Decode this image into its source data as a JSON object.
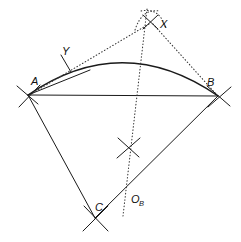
{
  "figure": {
    "canvas": {
      "width": 241,
      "height": 242,
      "background": "#ffffff"
    },
    "colors": {
      "solid_line": "#1a1a1a",
      "dotted_line": "#3a3a3a",
      "label_text": "#111111"
    },
    "labels": {
      "a": "A",
      "b": "B",
      "c": "C",
      "x": "X",
      "y": "Y",
      "o": "O",
      "o_sub": "B"
    },
    "points": {
      "A": {
        "x": 28,
        "y": 95
      },
      "B": {
        "x": 218,
        "y": 96
      },
      "C": {
        "x": 95,
        "y": 218
      },
      "X": {
        "x": 151,
        "y": 22
      },
      "Y": {
        "x": 66,
        "y": 63
      },
      "OB": {
        "x": 128,
        "y": 196
      },
      "arc_apex": {
        "x": 136,
        "y": 59
      },
      "mid_cross": {
        "x": 128,
        "y": 148
      }
    },
    "label_positions": {
      "A": {
        "x": 31,
        "y": 85
      },
      "B": {
        "x": 208,
        "y": 86
      },
      "C": {
        "x": 97,
        "y": 210
      },
      "X": {
        "x": 161,
        "y": 27
      },
      "Y": {
        "x": 66,
        "y": 56
      },
      "OB": {
        "x": 133,
        "y": 202
      }
    },
    "geometry": {
      "chord_AB": {
        "x1": 28,
        "y1": 95,
        "x2": 218,
        "y2": 96
      },
      "side_AC": {
        "x1": 28,
        "y1": 95,
        "x2": 95,
        "y2": 218
      },
      "side_CB": {
        "x1": 95,
        "y1": 218,
        "x2": 218,
        "y2": 96
      },
      "arc_AB_path": "M 28 95 Q 123 30 218 96",
      "dotted_X_to_A": {
        "x1": 151,
        "y1": 22,
        "x2": 30,
        "y2": 95
      },
      "dotted_X_to_B": {
        "x1": 151,
        "y1": 22,
        "x2": 217,
        "y2": 95
      },
      "dotted_bisector": {
        "x1": 147,
        "y1": 10,
        "x2": 124,
        "y2": 215
      }
    },
    "tick_marks": [
      {
        "name": "tick-at-A",
        "cx": 28,
        "cy": 95
      },
      {
        "name": "tick-at-B",
        "cx": 218,
        "cy": 96
      },
      {
        "name": "tick-at-C",
        "cx": 95,
        "cy": 218
      },
      {
        "name": "tick-at-Y",
        "cx": 66,
        "cy": 63
      },
      {
        "name": "arc-cross-at-X",
        "cx": 151,
        "cy": 22
      },
      {
        "name": "arc-cross-mid",
        "cx": 128,
        "cy": 148
      }
    ]
  }
}
